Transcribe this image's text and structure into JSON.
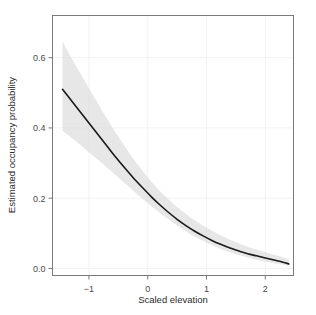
{
  "chart_data": {
    "type": "line",
    "title": "",
    "subtitle": "",
    "xlabel": "Scaled elevation",
    "ylabel": "Estimated occupancy probability",
    "xlim": [
      -1.62,
      2.48
    ],
    "ylim": [
      -0.02,
      0.72
    ],
    "xticks": [
      -1,
      0,
      1,
      2
    ],
    "xticklabels": [
      "−1",
      "0",
      "1",
      "2"
    ],
    "yticks": [
      0.0,
      0.2,
      0.4,
      0.6
    ],
    "yticklabels": [
      "0.0",
      "0.2",
      "0.4",
      "0.6"
    ],
    "grid": true,
    "grid_color": "#f2f2f2",
    "legend": null,
    "line_color": "#1a1a1a",
    "band_color": "#d9d9d9",
    "band_label": "95% confidence interval",
    "series": [
      {
        "name": "Estimated occupancy probability",
        "x": [
          -1.45,
          -1.3,
          -1.15,
          -1.0,
          -0.85,
          -0.7,
          -0.55,
          -0.4,
          -0.25,
          -0.1,
          0.05,
          0.2,
          0.35,
          0.5,
          0.65,
          0.8,
          0.95,
          1.1,
          1.25,
          1.4,
          1.55,
          1.7,
          1.85,
          2.0,
          2.15,
          2.3,
          2.4
        ],
        "values": [
          0.51,
          0.478,
          0.446,
          0.414,
          0.382,
          0.35,
          0.318,
          0.288,
          0.259,
          0.232,
          0.206,
          0.182,
          0.16,
          0.14,
          0.122,
          0.106,
          0.092,
          0.079,
          0.068,
          0.058,
          0.05,
          0.042,
          0.036,
          0.03,
          0.024,
          0.018,
          0.013
        ]
      },
      {
        "name": "upper 95% CI",
        "x": [
          -1.45,
          -1.3,
          -1.15,
          -1.0,
          -0.85,
          -0.7,
          -0.55,
          -0.4,
          -0.25,
          -0.1,
          0.05,
          0.2,
          0.35,
          0.5,
          0.65,
          0.8,
          0.95,
          1.1,
          1.25,
          1.4,
          1.55,
          1.7,
          1.85,
          2.0,
          2.15,
          2.3,
          2.4
        ],
        "values": [
          0.645,
          0.6,
          0.556,
          0.513,
          0.47,
          0.428,
          0.388,
          0.35,
          0.314,
          0.281,
          0.25,
          0.222,
          0.197,
          0.175,
          0.155,
          0.137,
          0.121,
          0.107,
          0.094,
          0.082,
          0.072,
          0.062,
          0.054,
          0.046,
          0.039,
          0.032,
          0.026
        ]
      },
      {
        "name": "lower 95% CI",
        "x": [
          -1.45,
          -1.3,
          -1.15,
          -1.0,
          -0.85,
          -0.7,
          -0.55,
          -0.4,
          -0.25,
          -0.1,
          0.05,
          0.2,
          0.35,
          0.5,
          0.65,
          0.8,
          0.95,
          1.1,
          1.25,
          1.4,
          1.55,
          1.7,
          1.85,
          2.0,
          2.15,
          2.3,
          2.4
        ],
        "values": [
          0.392,
          0.372,
          0.352,
          0.331,
          0.31,
          0.288,
          0.266,
          0.244,
          0.222,
          0.2,
          0.179,
          0.159,
          0.14,
          0.122,
          0.106,
          0.091,
          0.078,
          0.066,
          0.055,
          0.046,
          0.038,
          0.031,
          0.025,
          0.02,
          0.015,
          0.011,
          0.007
        ]
      }
    ]
  }
}
